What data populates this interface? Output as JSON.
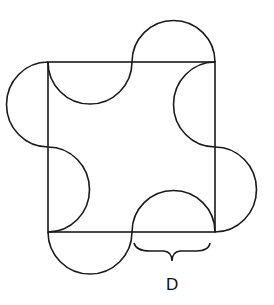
{
  "diagram": {
    "stroke_color": "#1a1a1a",
    "background": "#ffffff",
    "label": "D"
  }
}
